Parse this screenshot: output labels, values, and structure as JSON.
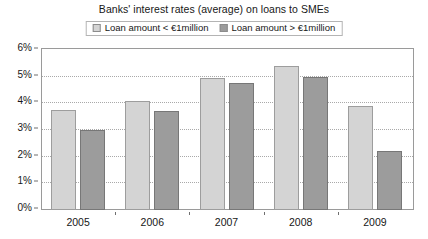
{
  "chart_data": {
    "type": "bar",
    "title": "Banks' interest rates (average) on loans to SMEs",
    "xlabel": "",
    "ylabel": "",
    "categories": [
      "2005",
      "2006",
      "2007",
      "2008",
      "2009"
    ],
    "series": [
      {
        "name": "Loan amount < €1million",
        "color": "#d4d4d4",
        "values": [
          3.75,
          4.1,
          4.95,
          5.4,
          3.9
        ]
      },
      {
        "name": "Loan amount > €1million",
        "color": "#9c9c9c",
        "values": [
          3.0,
          3.7,
          4.75,
          5.0,
          2.2
        ]
      }
    ],
    "ylim": [
      0,
      6
    ],
    "ytick_values": [
      0,
      1,
      2,
      3,
      4,
      5,
      6
    ],
    "ytick_labels": [
      "0%",
      "1%",
      "2%",
      "3%",
      "4%",
      "5%",
      "6%"
    ],
    "grid": true,
    "legend_position": "top-center"
  },
  "legend": {
    "items": [
      {
        "label": "Loan amount < €1million",
        "swatch": "series-light"
      },
      {
        "label": "Loan amount > €1million",
        "swatch": "series-dark"
      }
    ]
  }
}
